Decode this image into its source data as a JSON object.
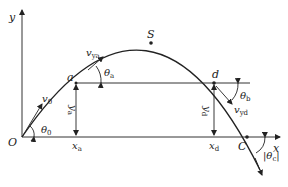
{
  "diagram": {
    "type": "projectile-motion-trajectory",
    "axes": {
      "x_label": "x",
      "y_label": "y",
      "origin_label": "O"
    },
    "points": {
      "origin": "O",
      "a": "a",
      "apex": "S",
      "d": "d",
      "landing": "C"
    },
    "labels": {
      "v0": {
        "main": "v",
        "sub": "0"
      },
      "theta0": {
        "main": "θ",
        "sub": "0"
      },
      "vya": {
        "main": "v",
        "sub": "ya"
      },
      "thetaa": {
        "main": "θ",
        "sub": "a"
      },
      "ya": {
        "main": "y",
        "sub": "a"
      },
      "xa": {
        "main": "x",
        "sub": "a"
      },
      "yd": {
        "main": "y",
        "sub": "d"
      },
      "xd": {
        "main": "x",
        "sub": "d"
      },
      "thetab": {
        "main": "θ",
        "sub": "b"
      },
      "vyd": {
        "main": "v",
        "sub": "yd"
      },
      "thetac": {
        "main": "|θ",
        "sub": "c",
        "close": "|"
      }
    },
    "colors": {
      "line": "#222222",
      "axis": "#333333",
      "background": "#ffffff"
    }
  }
}
